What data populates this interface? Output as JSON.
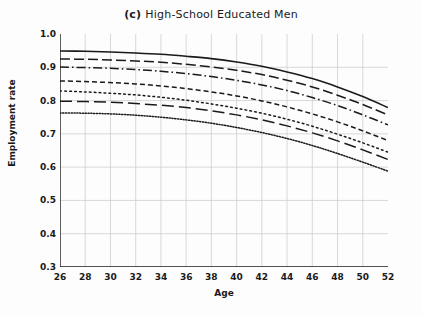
{
  "chart_data": {
    "type": "line",
    "title": "High-School Educated Men",
    "panel_label": "(c)",
    "xlabel": "Age",
    "ylabel": "Employment rate",
    "xlim": [
      26,
      52
    ],
    "ylim": [
      0.3,
      1.0
    ],
    "xticks": [
      26,
      28,
      30,
      32,
      34,
      36,
      38,
      40,
      42,
      44,
      46,
      48,
      50,
      52
    ],
    "yticks": [
      "1.0",
      "0.9",
      "0.8",
      "0.7",
      "0.6",
      "0.5",
      "0.4",
      "0.3"
    ],
    "grid": true,
    "legend": "none",
    "line_color": "#1a1a1a",
    "x": [
      26,
      28,
      30,
      32,
      34,
      36,
      38,
      40,
      42,
      44,
      46,
      48,
      50,
      52
    ],
    "series": [
      {
        "name": "cohort-1",
        "style": "solid",
        "values": [
          0.949,
          0.948,
          0.946,
          0.943,
          0.939,
          0.933,
          0.926,
          0.916,
          0.903,
          0.886,
          0.866,
          0.841,
          0.812,
          0.779
        ]
      },
      {
        "name": "cohort-2",
        "style": "long-dash",
        "values": [
          0.925,
          0.924,
          0.922,
          0.919,
          0.915,
          0.909,
          0.901,
          0.891,
          0.878,
          0.861,
          0.841,
          0.816,
          0.788,
          0.757
        ]
      },
      {
        "name": "cohort-3",
        "style": "dash-dot",
        "values": [
          0.901,
          0.899,
          0.897,
          0.893,
          0.888,
          0.881,
          0.872,
          0.861,
          0.847,
          0.83,
          0.809,
          0.785,
          0.757,
          0.727
        ]
      },
      {
        "name": "cohort-4",
        "style": "medium-dash",
        "values": [
          0.859,
          0.857,
          0.854,
          0.85,
          0.844,
          0.836,
          0.826,
          0.814,
          0.799,
          0.781,
          0.76,
          0.736,
          0.709,
          0.68
        ]
      },
      {
        "name": "cohort-5",
        "style": "dotted",
        "values": [
          0.829,
          0.826,
          0.822,
          0.817,
          0.81,
          0.801,
          0.79,
          0.777,
          0.762,
          0.744,
          0.723,
          0.699,
          0.673,
          0.645
        ]
      },
      {
        "name": "cohort-6",
        "style": "wide-long-dash",
        "values": [
          0.798,
          0.797,
          0.795,
          0.791,
          0.786,
          0.779,
          0.769,
          0.757,
          0.742,
          0.724,
          0.703,
          0.679,
          0.652,
          0.623
        ]
      },
      {
        "name": "cohort-7",
        "style": "fine-dotted",
        "values": [
          0.763,
          0.762,
          0.76,
          0.756,
          0.75,
          0.742,
          0.732,
          0.719,
          0.704,
          0.686,
          0.665,
          0.641,
          0.615,
          0.588
        ]
      }
    ]
  }
}
